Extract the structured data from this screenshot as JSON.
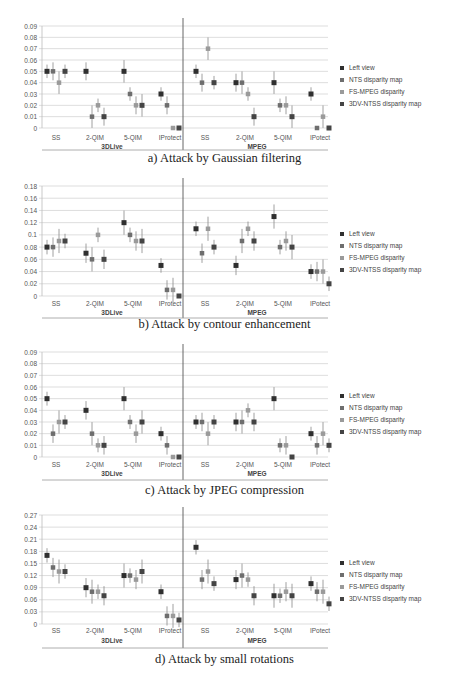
{
  "legend": {
    "items": [
      {
        "label": "Left view",
        "color": "#2f2f2f"
      },
      {
        "label": "NTS disparity map",
        "color": "#6e6e6e"
      },
      {
        "label": "FS-MPEG disparity",
        "color": "#9a9a9a"
      },
      {
        "label": "3DV-NTSS disparity map",
        "color": "#444444"
      }
    ]
  },
  "chart_data": [
    {
      "type": "scatter",
      "title": "a) Attack by Gaussian filtering",
      "groups": [
        "3DLive",
        "MPEG"
      ],
      "categories": [
        "SS",
        "2-QIM",
        "5-QIM",
        "IProtect"
      ],
      "category_labels_mpeg": [
        "SS",
        "2-QIM",
        "5-QIM",
        "IPotect"
      ],
      "yticks": [
        "0",
        "0.01",
        "0.02",
        "0.03",
        "0.04",
        "0.05",
        "0.06",
        "0.07",
        "0.08",
        "0.09"
      ],
      "ylim": [
        0,
        0.09
      ],
      "grid": true,
      "legend_position": "right",
      "series": [
        {
          "name": "Left view",
          "3DLive": [
            0.05,
            0.05,
            0.05,
            0.03
          ],
          "MPEG": [
            0.05,
            0.04,
            0.04,
            0.03
          ]
        },
        {
          "name": "NTS disparity map",
          "3DLive": [
            0.05,
            0.01,
            0.03,
            0.02
          ],
          "MPEG": [
            0.04,
            0.04,
            0.02,
            0.0
          ]
        },
        {
          "name": "FS-MPEG disparity",
          "3DLive": [
            0.04,
            0.02,
            0.02,
            0.0
          ],
          "MPEG": [
            0.07,
            0.03,
            0.02,
            0.01
          ]
        },
        {
          "name": "3DV-NTSS disparity map",
          "3DLive": [
            0.05,
            0.01,
            0.02,
            0.0
          ],
          "MPEG": [
            0.04,
            0.01,
            0.01,
            0.0
          ]
        }
      ]
    },
    {
      "type": "scatter",
      "title": "b) Attack by contour enhancement",
      "groups": [
        "3DLive",
        "MPEG"
      ],
      "categories": [
        "SS",
        "2-QIM",
        "5-QIM",
        "IProtect"
      ],
      "category_labels_mpeg": [
        "SS",
        "2-QIM",
        "5-QIM",
        "IPotect"
      ],
      "yticks": [
        "0",
        "0.02",
        "0.04",
        "0.06",
        "0.08",
        "0.1",
        "0.12",
        "0.14",
        "0.16",
        "0.18"
      ],
      "ylim": [
        0,
        0.18
      ],
      "grid": true,
      "legend_position": "right",
      "series": [
        {
          "name": "Left view",
          "3DLive": [
            0.08,
            0.07,
            0.12,
            0.05
          ],
          "MPEG": [
            0.11,
            0.05,
            0.13,
            0.04
          ]
        },
        {
          "name": "NTS disparity map",
          "3DLive": [
            0.08,
            0.06,
            0.1,
            0.01
          ],
          "MPEG": [
            0.07,
            0.09,
            0.08,
            0.04
          ]
        },
        {
          "name": "FS-MPEG disparity",
          "3DLive": [
            0.09,
            0.1,
            0.09,
            0.01
          ],
          "MPEG": [
            0.11,
            0.11,
            0.09,
            0.04
          ]
        },
        {
          "name": "3DV-NTSS disparity map",
          "3DLive": [
            0.09,
            0.06,
            0.09,
            0.0
          ],
          "MPEG": [
            0.08,
            0.09,
            0.08,
            0.02
          ]
        }
      ]
    },
    {
      "type": "scatter",
      "title": "c) Attack by JPEG compression",
      "groups": [
        "3DLive",
        "MPEG"
      ],
      "categories": [
        "SS",
        "2-QIM",
        "5-QIM",
        "IProtect"
      ],
      "category_labels_mpeg": [
        "SS",
        "2-QIM",
        "5-QIM",
        "IPotect"
      ],
      "yticks": [
        "0",
        "0.01",
        "0.02",
        "0.03",
        "0.04",
        "0.05",
        "0.06",
        "0.07",
        "0.08",
        "0.09"
      ],
      "ylim": [
        0,
        0.09
      ],
      "grid": true,
      "legend_position": "right",
      "series": [
        {
          "name": "Left view",
          "3DLive": [
            0.05,
            0.04,
            0.05,
            0.02
          ],
          "MPEG": [
            0.03,
            0.03,
            0.05,
            0.02
          ]
        },
        {
          "name": "NTS disparity map",
          "3DLive": [
            0.02,
            0.02,
            0.03,
            0.01
          ],
          "MPEG": [
            0.03,
            0.03,
            0.01,
            0.01
          ]
        },
        {
          "name": "FS-MPEG disparity",
          "3DLive": [
            0.03,
            0.01,
            0.02,
            0.0
          ],
          "MPEG": [
            0.02,
            0.04,
            0.01,
            0.02
          ]
        },
        {
          "name": "3DV-NTSS disparity map",
          "3DLive": [
            0.03,
            0.01,
            0.03,
            0.0
          ],
          "MPEG": [
            0.03,
            0.03,
            0.0,
            0.01
          ]
        }
      ]
    },
    {
      "type": "scatter",
      "title": "d) Attack by small rotations",
      "groups": [
        "3DLive",
        "MPEG"
      ],
      "categories": [
        "SS",
        "2-QIM",
        "5-QIM",
        "IProtect"
      ],
      "category_labels_mpeg": [
        "SS",
        "2-QIM",
        "5-QIM",
        "IPotect"
      ],
      "yticks": [
        "0",
        "0.03",
        "0.06",
        "0.09",
        "0.12",
        "0.15",
        "0.18",
        "0.21",
        "0.24",
        "0.27"
      ],
      "ylim": [
        0,
        0.27
      ],
      "grid": true,
      "legend_position": "right",
      "series": [
        {
          "name": "Left view",
          "3DLive": [
            0.17,
            0.09,
            0.12,
            0.08
          ],
          "MPEG": [
            0.19,
            0.11,
            0.07,
            0.1
          ]
        },
        {
          "name": "NTS disparity map",
          "3DLive": [
            0.14,
            0.08,
            0.12,
            0.02
          ],
          "MPEG": [
            0.11,
            0.12,
            0.07,
            0.08
          ]
        },
        {
          "name": "FS-MPEG disparity",
          "3DLive": [
            0.13,
            0.08,
            0.11,
            0.02
          ],
          "MPEG": [
            0.13,
            0.11,
            0.08,
            0.08
          ]
        },
        {
          "name": "3DV-NTSS disparity map",
          "3DLive": [
            0.13,
            0.07,
            0.13,
            0.01
          ],
          "MPEG": [
            0.1,
            0.07,
            0.07,
            0.05
          ]
        }
      ]
    }
  ]
}
